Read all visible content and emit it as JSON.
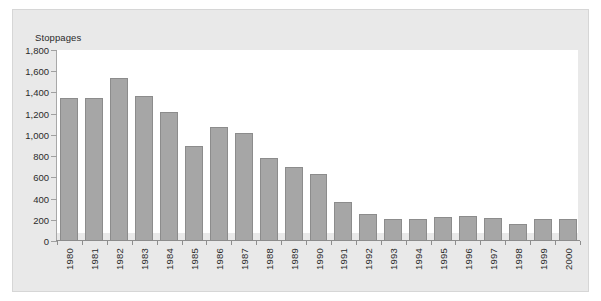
{
  "chart_data": {
    "type": "bar",
    "title": "",
    "subtitle": "",
    "ylabel": "Stoppages",
    "xlabel": "",
    "ylim": [
      0,
      1800
    ],
    "ytick_step": 200,
    "yticks": [
      0,
      200,
      400,
      600,
      800,
      1000,
      1200,
      1400,
      1600,
      1800
    ],
    "ytick_labels": [
      "0",
      "200",
      "400",
      "600",
      "800",
      "1,000",
      "1,200",
      "1,400",
      "1,600",
      "1,800"
    ],
    "grid": false,
    "legend": null,
    "categories": [
      "1980",
      "1981",
      "1982",
      "1983",
      "1984",
      "1985",
      "1986",
      "1987",
      "1988",
      "1989",
      "1990",
      "1991",
      "1992",
      "1993",
      "1994",
      "1995",
      "1996",
      "1997",
      "1998",
      "1999",
      "2000"
    ],
    "values": [
      1350,
      1345,
      1540,
      1365,
      1220,
      895,
      1075,
      1015,
      785,
      695,
      630,
      370,
      250,
      210,
      205,
      230,
      235,
      215,
      165,
      205,
      210
    ],
    "colors": {
      "bar_fill": "#a6a6a6",
      "bar_stroke": "#8c8c8c",
      "plot_background": "#ffffff",
      "figure_background": "#e9e9e9",
      "axis": "#8e8e8e",
      "text": "#2b2b2b"
    }
  }
}
